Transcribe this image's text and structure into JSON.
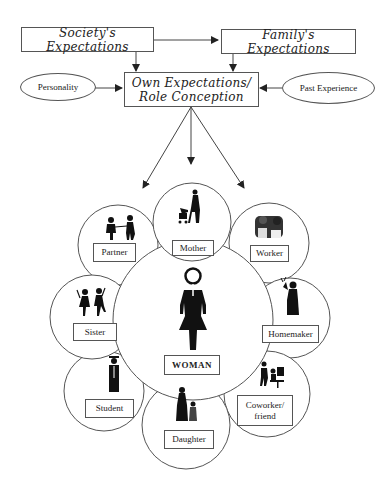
{
  "diagram": {
    "top_boxes": {
      "society": "Society's Expectations",
      "family": "Family's Expectations",
      "own_line1": "Own Expectations/",
      "own_line2": "Role Conception"
    },
    "influences": {
      "personality": "Personality",
      "past_experience": "Past Experience"
    },
    "center": {
      "label": "WOMAN",
      "icon": "female-symbol-figure-icon"
    },
    "roles": [
      {
        "label": "Mother",
        "icon": "mother-with-stroller-icon"
      },
      {
        "label": "Worker",
        "icon": "workers-group-icon"
      },
      {
        "label": "Homemaker",
        "icon": "homemaker-with-plant-icon"
      },
      {
        "label_line1": "Coworker/",
        "label_line2": "friend",
        "icon": "coworker-at-desk-icon"
      },
      {
        "label": "Daughter",
        "icon": "mother-and-daughter-icon"
      },
      {
        "label": "Student",
        "icon": "graduate-icon"
      },
      {
        "label": "Sister",
        "icon": "dancing-sisters-icon"
      },
      {
        "label": "Partner",
        "icon": "couple-icon"
      }
    ],
    "edges": [
      {
        "from": "Society's Expectations",
        "to": "Family's Expectations"
      },
      {
        "from": "Society's Expectations",
        "to": "Own Expectations/Role Conception"
      },
      {
        "from": "Family's Expectations",
        "to": "Own Expectations/Role Conception"
      },
      {
        "from": "Personality",
        "to": "Own Expectations/Role Conception"
      },
      {
        "from": "Past Experience",
        "to": "Own Expectations/Role Conception"
      },
      {
        "from": "Own Expectations/Role Conception",
        "to": "Partner"
      },
      {
        "from": "Own Expectations/Role Conception",
        "to": "Mother"
      },
      {
        "from": "Own Expectations/Role Conception",
        "to": "Worker"
      }
    ]
  }
}
